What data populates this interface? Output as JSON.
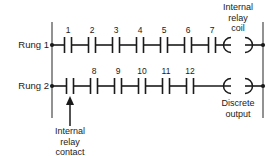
{
  "diagram": {
    "type": "ladder-logic",
    "rails": {
      "left_x": 52,
      "right_x": 263,
      "top_y": 22,
      "bottom_y": 118
    },
    "rungs": [
      {
        "id": "rung-1",
        "label": "Rung 1",
        "y": 45,
        "contacts": [
          {
            "label": "1",
            "x": 68
          },
          {
            "label": "2",
            "x": 92
          },
          {
            "label": "3",
            "x": 116
          },
          {
            "label": "4",
            "x": 140
          },
          {
            "label": "5",
            "x": 164
          },
          {
            "label": "6",
            "x": 188
          },
          {
            "label": "7",
            "x": 212
          }
        ],
        "output": {
          "kind": "coil",
          "x": 238,
          "label": "Internal\nrelay\ncoil",
          "label_lines": [
            "Internal",
            "relay",
            "coil"
          ],
          "label_position": "above"
        }
      },
      {
        "id": "rung-2",
        "label": "Rung 2",
        "y": 86,
        "contacts": [
          {
            "label": "",
            "x": 70
          },
          {
            "label": "8",
            "x": 94
          },
          {
            "label": "9",
            "x": 118
          },
          {
            "label": "10",
            "x": 142
          },
          {
            "label": "11",
            "x": 166
          },
          {
            "label": "12",
            "x": 190
          }
        ],
        "output": {
          "kind": "coil",
          "x": 238,
          "label": "Discrete\noutput",
          "label_lines": [
            "Discrete",
            "output"
          ],
          "label_position": "below"
        }
      }
    ],
    "annotations": [
      {
        "id": "internal-relay-contact",
        "label_lines": [
          "Internal",
          "relay",
          "contact"
        ],
        "arrow_from": {
          "x": 70,
          "y": 128
        },
        "arrow_to": {
          "x": 70,
          "y": 96
        },
        "label_x": 70,
        "label_y": 130
      }
    ],
    "colors": {
      "ink": "#1a1a1a",
      "rail": "#6e6e6e",
      "background": "#ffffff"
    }
  },
  "labels": {
    "rung1": "Rung 1",
    "rung2": "Rung 2",
    "internal_relay_coil_l1": "Internal",
    "internal_relay_coil_l2": "relay",
    "internal_relay_coil_l3": "coil",
    "discrete_output_l1": "Discrete",
    "discrete_output_l2": "output",
    "internal_relay_contact_l1": "Internal",
    "internal_relay_contact_l2": "relay",
    "internal_relay_contact_l3": "contact",
    "c1": "1",
    "c2": "2",
    "c3": "3",
    "c4": "4",
    "c5": "5",
    "c6": "6",
    "c7": "7",
    "c8": "8",
    "c9": "9",
    "c10": "10",
    "c11": "11",
    "c12": "12"
  }
}
